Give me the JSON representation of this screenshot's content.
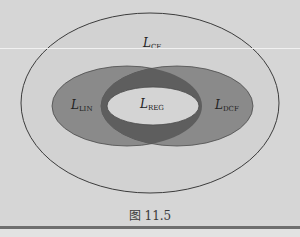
{
  "diagram": {
    "colors": {
      "background": "#d6d6d6",
      "outer_fill": "#d2d2d2",
      "lens_fill": "#8a8a8a",
      "overlap_fill": "#5e5e5e",
      "inner_fill": "#d4d4d4",
      "stroke": "#3c3c3c"
    },
    "regions": [
      {
        "id": "cf",
        "label_main": "L",
        "label_sub": "CF"
      },
      {
        "id": "lin",
        "label_main": "L",
        "label_sub": "LIN"
      },
      {
        "id": "dcf",
        "label_main": "L",
        "label_sub": "DCF"
      },
      {
        "id": "reg",
        "label_main": "L",
        "label_sub": "REG"
      }
    ]
  },
  "caption": "图 11.5"
}
